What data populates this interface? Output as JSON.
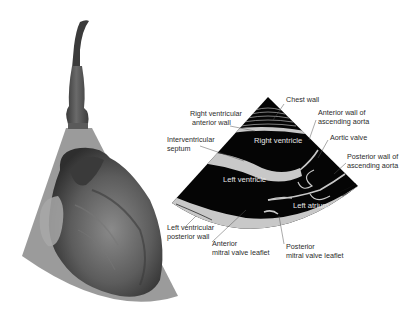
{
  "figure": {
    "left_panel": {
      "description": "Ultrasound transducer placed over 3D heart illustration with imaging sector",
      "probe_color": "#4a4a4a",
      "sector_color": "#7a7a7a",
      "heart_color": "#5a5a5a"
    },
    "echo_panel": {
      "description": "Parasternal long-axis echocardiogram sector",
      "background": "#050505",
      "tissue_color": "#c8c8c8",
      "chamber_labels": {
        "right_ventricle": "Right ventricle",
        "left_ventricle": "Left ventricle",
        "left_atrium": "Left atrium"
      }
    },
    "labels": {
      "chest_wall": "Chest wall",
      "rv_anterior_wall": [
        "Right ventricular",
        "anterior wall"
      ],
      "ivs": [
        "Interventricular",
        "septum"
      ],
      "aorta_anterior": [
        "Anterior wall of",
        "ascending aorta"
      ],
      "aortic_valve": "Aortic valve",
      "aorta_posterior": [
        "Posterior wall of",
        "ascending aorta"
      ],
      "lv_posterior_wall": [
        "Left ventricular",
        "posterior wall"
      ],
      "amvl": [
        "Anterior",
        "mitral valve leaflet"
      ],
      "pmvl": [
        "Posterior",
        "mitral valve leaflet"
      ]
    }
  }
}
